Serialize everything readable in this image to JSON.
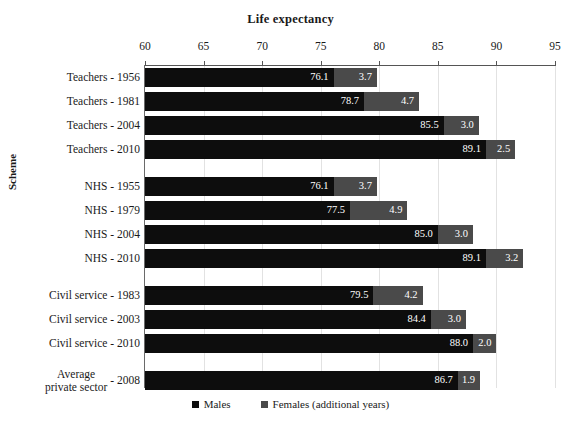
{
  "chart_data": {
    "type": "bar",
    "orientation": "horizontal",
    "stacked": true,
    "title": "Life expectancy",
    "xlabel": "",
    "ylabel": "Scheme",
    "xlim": [
      60,
      95
    ],
    "xticks": [
      60,
      65,
      70,
      75,
      80,
      85,
      90,
      95
    ],
    "grid": true,
    "legend_position": "bottom",
    "categories": [
      "Teachers - 1956",
      "Teachers - 1981",
      "Teachers - 2004",
      "Teachers - 2010",
      "NHS - 1955",
      "NHS - 1979",
      "NHS - 2004",
      "NHS - 2010",
      "Civil service - 1983",
      "Civil service - 2003",
      "Civil service - 2010",
      "Average private sector - 2008"
    ],
    "series": [
      {
        "name": "Males",
        "color": "#0d0d0d",
        "values": [
          76.1,
          78.7,
          85.5,
          89.1,
          76.1,
          77.5,
          85.0,
          89.1,
          79.5,
          84.4,
          88.0,
          86.7
        ]
      },
      {
        "name": "Females (additional years)",
        "color": "#4a4a4a",
        "values": [
          3.7,
          4.7,
          3.0,
          2.5,
          3.7,
          4.9,
          3.0,
          3.2,
          4.2,
          3.0,
          2.0,
          1.9
        ]
      }
    ],
    "groups": [
      {
        "name": "Teachers",
        "count": 4
      },
      {
        "name": "NHS",
        "count": 4
      },
      {
        "name": "Civil service",
        "count": 3
      },
      {
        "name": "Average private sector",
        "count": 1
      }
    ]
  },
  "rows": [
    {
      "label": "Teachers - 1956",
      "label_line1": "Teachers - 1956",
      "label_line2": "",
      "male": "76.1",
      "female": "3.7"
    },
    {
      "label": "Teachers - 1981",
      "label_line1": "Teachers - 1981",
      "label_line2": "",
      "male": "78.7",
      "female": "4.7"
    },
    {
      "label": "Teachers - 2004",
      "label_line1": "Teachers - 2004",
      "label_line2": "",
      "male": "85.5",
      "female": "3.0"
    },
    {
      "label": "Teachers - 2010",
      "label_line1": "Teachers - 2010",
      "label_line2": "",
      "male": "89.1",
      "female": "2.5"
    },
    {
      "label": "NHS - 1955",
      "label_line1": "NHS - 1955",
      "label_line2": "",
      "male": "76.1",
      "female": "3.7"
    },
    {
      "label": "NHS - 1979",
      "label_line1": "NHS - 1979",
      "label_line2": "",
      "male": "77.5",
      "female": "4.9"
    },
    {
      "label": "NHS - 2004",
      "label_line1": "NHS - 2004",
      "label_line2": "",
      "male": "85.0",
      "female": "3.0"
    },
    {
      "label": "NHS - 2010",
      "label_line1": "NHS - 2010",
      "label_line2": "",
      "male": "89.1",
      "female": "3.2"
    },
    {
      "label": "Civil service - 1983",
      "label_line1": "Civil service - 1983",
      "label_line2": "",
      "male": "79.5",
      "female": "4.2"
    },
    {
      "label": "Civil service - 2003",
      "label_line1": "Civil service - 2003",
      "label_line2": "",
      "male": "84.4",
      "female": "3.0"
    },
    {
      "label": "Civil service - 2010",
      "label_line1": "Civil service - 2010",
      "label_line2": "",
      "male": "88.0",
      "female": "2.0"
    },
    {
      "label": "Average private sector - 2008",
      "label_line1": "Average",
      "label_line2": "private sector",
      "suffix": "- 2008",
      "male": "86.7",
      "female": "1.9"
    }
  ],
  "axis": {
    "tick_labels": [
      "60",
      "65",
      "70",
      "75",
      "80",
      "85",
      "90",
      "95"
    ],
    "y_title": "Scheme"
  },
  "legend": {
    "items": [
      {
        "label": "Males",
        "color": "#0d0d0d"
      },
      {
        "label": "Females (additional years)",
        "color": "#4a4a4a"
      }
    ]
  },
  "colors": {
    "male": "#0d0d0d",
    "female": "#4a4a4a",
    "grid": "#e2e2e2",
    "axis": "#555555",
    "background": "#ffffff"
  }
}
